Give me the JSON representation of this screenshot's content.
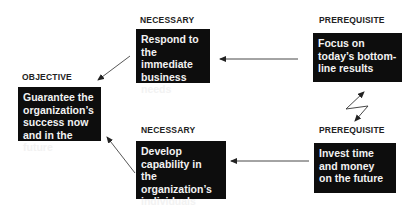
{
  "diagram": {
    "nodes": [
      {
        "id": "objective",
        "label": "OBJECTIVE",
        "text": "Guarantee the\norganization’s\nsuccess now\nand in the future"
      },
      {
        "id": "necessary_top",
        "label": "NECESSARY",
        "text": "Respond to\nthe immediate\nbusiness\nneeds"
      },
      {
        "id": "prereq_top",
        "label": "PREREQUISITE",
        "text": "Focus on\ntoday’s bottom-\nline results"
      },
      {
        "id": "necessary_bottom",
        "label": "NECESSARY",
        "text": "Develop\ncapability in\nthe organization’s\nindividuals"
      },
      {
        "id": "prereq_bottom",
        "label": "PREREQUISITE",
        "text": "Invest time\nand money\non the future"
      }
    ],
    "edges": [
      {
        "from": "necessary_top",
        "to": "objective",
        "style": "arrow"
      },
      {
        "from": "necessary_bottom",
        "to": "objective",
        "style": "arrow"
      },
      {
        "from": "prereq_top",
        "to": "necessary_top",
        "style": "arrow"
      },
      {
        "from": "prereq_bottom",
        "to": "necessary_bottom",
        "style": "arrow"
      },
      {
        "from": "prereq_top",
        "to": "prereq_bottom",
        "style": "conflict-lightning"
      }
    ],
    "colors": {
      "box_bg": "#0d0d0d",
      "box_text": "#f2f2f2",
      "label": "#222222",
      "line": "#333333"
    }
  }
}
